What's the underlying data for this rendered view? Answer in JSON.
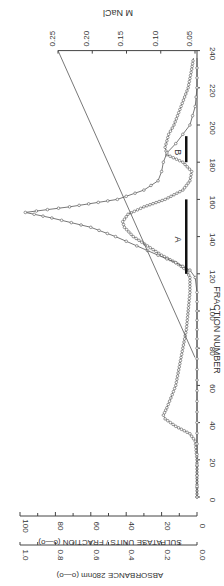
{
  "chart_data": {
    "type": "line",
    "orientation": "rotated-90-clockwise",
    "title": "",
    "xlabel": "FRACTION NUMBER",
    "ylabel_left_outer": "ABSORBANCE 280nm (o—o)",
    "ylabel_left_inner": "SULFATASE UNITS / FRACTION (o—o)",
    "ylabel_right": "M NaCl",
    "x_ticks": [
      0,
      20,
      40,
      60,
      80,
      100,
      120,
      140,
      160,
      180,
      200,
      220,
      240
    ],
    "xlim": [
      0,
      240
    ],
    "sulfatase_ticks": [
      0,
      20,
      40,
      60,
      80,
      100
    ],
    "sulfatase_lim": [
      0,
      100
    ],
    "absorbance_ticks": [
      "0.0",
      "0.2",
      "0.4",
      "0.6",
      "0.8",
      "1.0"
    ],
    "absorbance_lim": [
      0,
      1.0
    ],
    "nacl_ticks": [
      "0.05",
      "0.10",
      "0.15",
      "0.20",
      "0.25"
    ],
    "nacl_lim": [
      0.05,
      0.25
    ],
    "grid": false,
    "series": [
      {
        "name": "Absorbance 280nm",
        "axis": "absorbance",
        "x": [
          0,
          10,
          20,
          30,
          34,
          38,
          42,
          44,
          48,
          55,
          60,
          70,
          80,
          90,
          100,
          110,
          118,
          122,
          126,
          130,
          135,
          140,
          145,
          148,
          152,
          156,
          160,
          165,
          170,
          175,
          180,
          184,
          188,
          195,
          200,
          210,
          220,
          230,
          236
        ],
        "values": [
          0.0,
          0.0,
          0.0,
          0.01,
          0.04,
          0.12,
          0.18,
          0.19,
          0.17,
          0.14,
          0.12,
          0.1,
          0.08,
          0.06,
          0.05,
          0.04,
          0.04,
          0.06,
          0.12,
          0.2,
          0.28,
          0.36,
          0.41,
          0.42,
          0.39,
          0.3,
          0.18,
          0.08,
          0.04,
          0.03,
          0.08,
          0.17,
          0.18,
          0.16,
          0.13,
          0.09,
          0.05,
          0.03,
          0.02
        ]
      },
      {
        "name": "Sulfatase units / fraction",
        "axis": "sulfatase",
        "x": [
          0,
          40,
          80,
          110,
          118,
          122,
          126,
          130,
          135,
          140,
          145,
          150,
          153,
          156,
          160,
          165,
          170,
          175,
          180,
          185,
          190,
          195,
          200,
          210,
          220,
          236
        ],
        "values": [
          0,
          0,
          0,
          0,
          1,
          4,
          12,
          22,
          34,
          46,
          60,
          82,
          97,
          72,
          45,
          30,
          22,
          20,
          19,
          17,
          12,
          8,
          4,
          1,
          0,
          0
        ]
      },
      {
        "name": "M NaCl gradient",
        "axis": "nacl",
        "x": [
          75,
          240
        ],
        "values": [
          0.05,
          0.25
        ]
      }
    ],
    "annotations": [
      {
        "label": "A",
        "from": 120,
        "to": 160
      },
      {
        "label": "B",
        "from": 180,
        "to": 194
      }
    ]
  }
}
